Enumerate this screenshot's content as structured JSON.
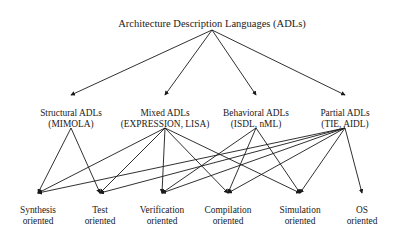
{
  "diagram": {
    "type": "hierarchy-tree",
    "colors": {
      "background": "#ffffff",
      "edge": "#1a1a1a",
      "text": "#1a1a1a"
    },
    "root": {
      "id": "adls",
      "label": "Architecture Description Languages (ADLs)",
      "x": 212,
      "y": 18
    },
    "categories": [
      {
        "id": "structural",
        "line1": "Structural ADLs",
        "line2": "(MIMOLA)",
        "x": 71,
        "y": 108
      },
      {
        "id": "mixed",
        "line1": "Mixed ADLs",
        "line2": "(EXPRESSION, LISA)",
        "x": 165,
        "y": 108
      },
      {
        "id": "behavioral",
        "line1": "Behavioral ADLs",
        "line2": "(ISDL, nML)",
        "x": 256,
        "y": 108
      },
      {
        "id": "partial",
        "line1": "Partial ADLs",
        "line2": "(TIE, AIDL)",
        "x": 345,
        "y": 108
      }
    ],
    "applications": [
      {
        "id": "synthesis",
        "line1": "Synthesis",
        "line2": "oriented",
        "x": 38,
        "y": 205
      },
      {
        "id": "test",
        "line1": "Test",
        "line2": "oriented",
        "x": 100,
        "y": 205
      },
      {
        "id": "verification",
        "line1": "Verification",
        "line2": "oriented",
        "x": 162,
        "y": 205
      },
      {
        "id": "compilation",
        "line1": "Compilation",
        "line2": "oriented",
        "x": 228,
        "y": 205
      },
      {
        "id": "simulation",
        "line1": "Simulation",
        "line2": "oriented",
        "x": 300,
        "y": 205
      },
      {
        "id": "os",
        "line1": "OS",
        "line2": "oriented",
        "x": 362,
        "y": 205
      }
    ],
    "edges_root_to_category": [
      {
        "from": "adls",
        "to": "structural"
      },
      {
        "from": "adls",
        "to": "mixed"
      },
      {
        "from": "adls",
        "to": "behavioral"
      },
      {
        "from": "adls",
        "to": "partial"
      }
    ],
    "edges_category_to_application": [
      {
        "from": "structural",
        "to": "synthesis"
      },
      {
        "from": "structural",
        "to": "test"
      },
      {
        "from": "mixed",
        "to": "synthesis"
      },
      {
        "from": "mixed",
        "to": "test"
      },
      {
        "from": "mixed",
        "to": "verification"
      },
      {
        "from": "mixed",
        "to": "compilation"
      },
      {
        "from": "mixed",
        "to": "simulation"
      },
      {
        "from": "behavioral",
        "to": "verification"
      },
      {
        "from": "behavioral",
        "to": "compilation"
      },
      {
        "from": "behavioral",
        "to": "simulation"
      },
      {
        "from": "partial",
        "to": "synthesis"
      },
      {
        "from": "partial",
        "to": "test"
      },
      {
        "from": "partial",
        "to": "verification"
      },
      {
        "from": "partial",
        "to": "compilation"
      },
      {
        "from": "partial",
        "to": "simulation"
      },
      {
        "from": "partial",
        "to": "os"
      }
    ]
  }
}
